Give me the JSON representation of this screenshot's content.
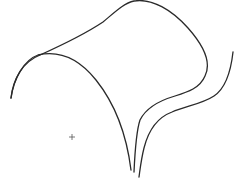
{
  "drawing": {
    "background": "#ffffff",
    "stroke_color": "#2a2a2a",
    "stroke_width": 1.3,
    "curves": [
      {
        "name": "outer-top-arc-and-loop",
        "d": "M 11 98 C 13 80, 22 62, 40 55 C 60 46, 85 34, 103 22 C 115 12, 124 3, 134 1 C 152 -2, 172 10, 188 28 C 204 46, 212 62, 205 76 C 200 88, 188 92, 175 96 C 158 101, 146 108, 140 120 C 136 132, 135 150, 134 172"
      },
      {
        "name": "inner-left-arch",
        "d": "M 11 98 C 14 78, 24 60, 38 55 C 60 50, 80 60, 96 80 C 112 100, 126 130, 131 170"
      },
      {
        "name": "outer-right-s-curve",
        "d": "M 233 52 C 231 70, 226 88, 214 96 C 202 104, 186 106, 172 112 C 156 118, 148 132, 144 148 C 141 160, 140 170, 139 177"
      }
    ],
    "marker": {
      "name": "cross-marker",
      "x": 72,
      "y": 137,
      "size": 3
    }
  }
}
